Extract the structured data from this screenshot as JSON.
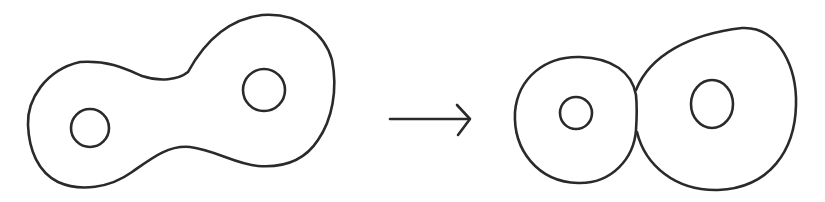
{
  "diagram": {
    "colors": {
      "stroke": "#2a2a2a",
      "background": "#ffffff"
    },
    "left": {
      "label": "",
      "shape": "genus-2-surface",
      "holes": 2
    },
    "arrow": {
      "label": "",
      "direction": "right"
    },
    "right": {
      "label": "",
      "shape": "two-tori-touching",
      "components": 2
    }
  }
}
